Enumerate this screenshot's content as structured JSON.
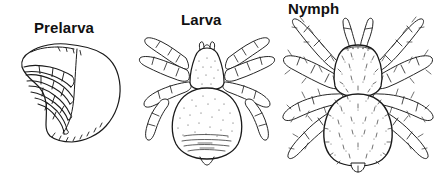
{
  "figure": {
    "background_color": "#ffffff",
    "ink_color": "#1a1a1a",
    "label_color": "#111111",
    "width": 440,
    "height": 175
  },
  "stages": [
    {
      "id": "prelarva",
      "label": "Prelarva",
      "legs": 4,
      "description": "Rounded sac-like prelarva in lateral view with four short segmented leg buds"
    },
    {
      "id": "larva",
      "label": "Larva",
      "legs": 6,
      "description": "Dorsal view of six-legged larva with trapezoidal cephalothorax and large oval stippled abdomen"
    },
    {
      "id": "nymph",
      "label": "Nymph",
      "legs": 8,
      "description": "Dorsal view of eight-legged nymph with setae-covered legs, pedipalps and shield-shaped prosoma"
    }
  ]
}
